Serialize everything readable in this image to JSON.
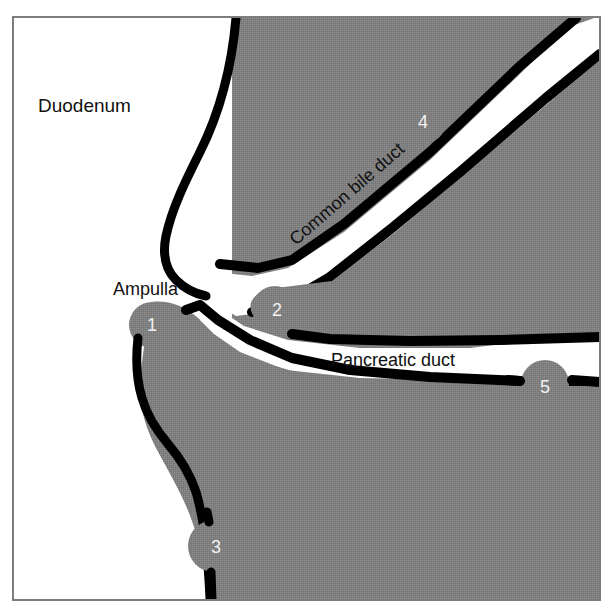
{
  "figure": {
    "border_color": "#7d7d7d",
    "tissue_color": "#808080",
    "outline_color": "#000000",
    "lumen_color": "#ffffff",
    "background_color": "#ffffff",
    "marker_text_color": "#f2f2f2",
    "label_text_color": "#111111"
  },
  "labels": {
    "duodenum": "Duodenum",
    "ampulla": "Ampulla",
    "common_bile_duct": "Common bile duct",
    "pancreatic_duct": "Pancreatic duct"
  },
  "markers": [
    {
      "id": "1",
      "label": "1",
      "x": 152,
      "y": 325,
      "r": 23
    },
    {
      "id": "2",
      "label": "2",
      "x": 276,
      "y": 309,
      "r": 23
    },
    {
      "id": "3",
      "label": "3",
      "x": 215,
      "y": 546,
      "r": 25
    },
    {
      "id": "4",
      "label": "4",
      "x": 423,
      "y": 121,
      "r": 23
    },
    {
      "id": "5",
      "label": "5",
      "x": 545,
      "y": 385,
      "r": 24
    }
  ],
  "text_placements": {
    "duodenum": {
      "x": 38,
      "y": 112,
      "size": 19,
      "rotation": 0
    },
    "ampulla": {
      "x": 113,
      "y": 295,
      "size": 18,
      "rotation": 0
    },
    "common_bile_duct": {
      "x": 296,
      "y": 246,
      "size": 18,
      "rotation": -41
    },
    "pancreatic_duct": {
      "x": 331,
      "y": 366,
      "size": 18,
      "rotation": 0
    }
  },
  "structures": [
    {
      "name": "duodenum-lumen",
      "kind": "white-region"
    },
    {
      "name": "duodenal-wall",
      "kind": "gray-tissue"
    },
    {
      "name": "common-bile-duct-lumen",
      "kind": "white-channel"
    },
    {
      "name": "pancreatic-duct-lumen",
      "kind": "white-channel"
    },
    {
      "name": "pancreas-tissue",
      "kind": "gray-tissue"
    },
    {
      "name": "ampulla-of-vater",
      "kind": "gray-tissue"
    }
  ]
}
